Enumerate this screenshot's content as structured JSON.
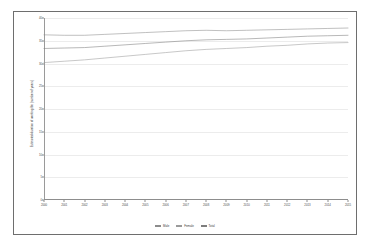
{
  "chart_data": {
    "type": "line",
    "title": "",
    "xlabel": "",
    "ylabel": "Estimated duration of working life (number of years)",
    "x": [
      2000,
      2001,
      2002,
      2003,
      2004,
      2005,
      2006,
      2007,
      2008,
      2009,
      2010,
      2011,
      2012,
      2013,
      2014,
      2015
    ],
    "categories": [
      "2000",
      "2001",
      "2002",
      "2003",
      "2004",
      "2005",
      "2006",
      "2007",
      "2008",
      "2009",
      "2010",
      "2011",
      "2012",
      "2013",
      "2014",
      "2015"
    ],
    "ylim": [
      0,
      40
    ],
    "xlim": [
      2000,
      2015
    ],
    "yticks": [
      0,
      5,
      10,
      15,
      20,
      25,
      30,
      35,
      40
    ],
    "ytick_labels": [
      "0",
      "5",
      "10",
      "15",
      "20",
      "25",
      "30",
      "35",
      "40"
    ],
    "grid": true,
    "legend_position": "bottom",
    "series": [
      {
        "name": "Male",
        "color": "#8c8c8c",
        "values": [
          36.3,
          36.2,
          36.2,
          36.4,
          36.6,
          36.8,
          37.0,
          37.2,
          37.3,
          37.2,
          37.3,
          37.4,
          37.5,
          37.6,
          37.7,
          37.8
        ]
      },
      {
        "name": "Female",
        "color": "#9a9a9a",
        "values": [
          30.2,
          30.5,
          30.8,
          31.2,
          31.6,
          32.0,
          32.4,
          32.8,
          33.1,
          33.3,
          33.5,
          33.8,
          34.0,
          34.3,
          34.5,
          34.6
        ]
      },
      {
        "name": "Total",
        "color": "#7d7d7d",
        "values": [
          33.3,
          33.4,
          33.5,
          33.8,
          34.1,
          34.4,
          34.7,
          35.0,
          35.2,
          35.3,
          35.4,
          35.6,
          35.8,
          36.0,
          36.1,
          36.2
        ]
      }
    ]
  },
  "legend": {
    "items": [
      {
        "label": "Male",
        "color": "#8c8c8c"
      },
      {
        "label": "Female",
        "color": "#9a9a9a"
      },
      {
        "label": "Total",
        "color": "#7d7d7d"
      }
    ]
  },
  "axes": {
    "y_title": "Estimated duration of working life (number of years)"
  }
}
